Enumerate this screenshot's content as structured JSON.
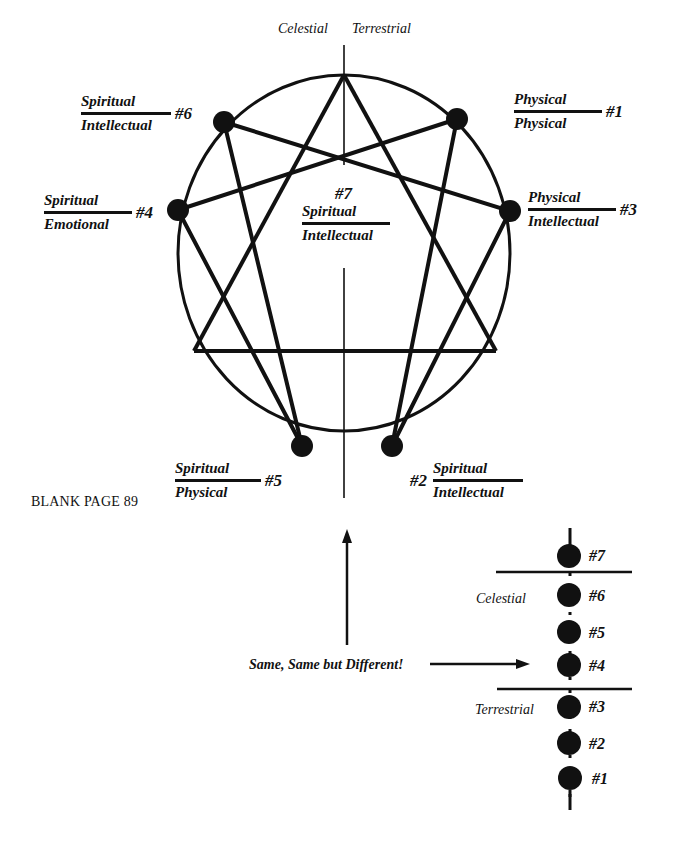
{
  "top_axis": {
    "left_label": "Celestial",
    "right_label": "Terrestrial"
  },
  "points": {
    "p1": {
      "number": "#1",
      "top": "Physical",
      "bottom": "Physical"
    },
    "p2": {
      "number": "#2",
      "top": "Spiritual",
      "bottom": "Intellectual"
    },
    "p3": {
      "number": "#3",
      "top": "Physical",
      "bottom": "Intellectual"
    },
    "p4": {
      "number": "#4",
      "top": "Spiritual",
      "bottom": "Emotional"
    },
    "p5": {
      "number": "#5",
      "top": "Spiritual",
      "bottom": "Physical"
    },
    "p6": {
      "number": "#6",
      "top": "Spiritual",
      "bottom": "Intellectual"
    },
    "p7": {
      "number": "#7",
      "top": "Spiritual",
      "bottom": "Intellectual"
    }
  },
  "page_note": "BLANK PAGE 89",
  "arrow_caption": "Same, Same but Different!",
  "scale": {
    "celestial_label": "Celestial",
    "terrestrial_label": "Terrestrial",
    "levels": [
      "#7",
      "#6",
      "#5",
      "#4",
      "#3",
      "#2",
      "#1"
    ]
  },
  "colors": {
    "ink": "#111111",
    "background": "#ffffff"
  }
}
